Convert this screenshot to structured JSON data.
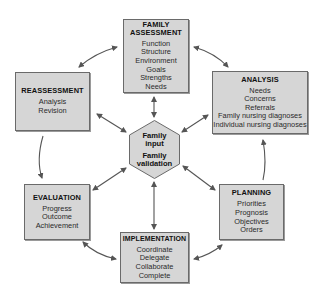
{
  "diagram": {
    "center": {
      "line1": "Family",
      "line2": "input",
      "line3": "Family",
      "line4": "validation"
    },
    "nodes": {
      "family_assessment": {
        "title_line1": "FAMILY",
        "title_line2": "ASSESSMENT",
        "items": [
          "Function",
          "Structure",
          "Environment",
          "Goals",
          "Strengths",
          "Needs"
        ]
      },
      "analysis": {
        "title": "ANALYSIS",
        "items": [
          "Needs",
          "Concerns",
          "Referrals",
          "Family nursing diagnoses",
          "Individual nursing diagnoses"
        ]
      },
      "planning": {
        "title": "PLANNING",
        "items": [
          "Priorities",
          "Prognosis",
          "Objectives",
          "Orders"
        ]
      },
      "implementation": {
        "title": "IMPLEMENTATION",
        "items": [
          "Coordinate",
          "Delegate",
          "Collaborate",
          "Complete"
        ]
      },
      "evaluation": {
        "title": "EVALUATION",
        "items": [
          "Progress",
          "Outcome",
          "Achievement"
        ]
      },
      "reassessment": {
        "title": "REASSESSMENT",
        "items": [
          "Analysis",
          "Revision"
        ]
      }
    },
    "colors": {
      "box_fill": "#d6d6d6",
      "box_border": "#6a6a6a",
      "arrow": "#555555"
    }
  }
}
